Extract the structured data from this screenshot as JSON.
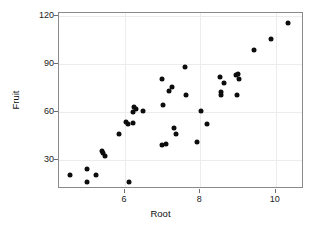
{
  "chart_data": {
    "type": "scatter",
    "title": "",
    "xlabel": "Root",
    "ylabel": "Fruit",
    "xlim": [
      4.25,
      10.75
    ],
    "ylim": [
      12,
      122
    ],
    "xticks": [
      6,
      8,
      10
    ],
    "yticks": [
      30,
      60,
      90,
      120
    ],
    "grid": true,
    "legend": null,
    "marker": "filled-circle",
    "marker_color": "#0d0d0d",
    "n_points": 40,
    "points": [
      {
        "x": 4.55,
        "y": 21.0
      },
      {
        "x": 5.0,
        "y": 24.5
      },
      {
        "x": 4.98,
        "y": 16.5
      },
      {
        "x": 5.22,
        "y": 21.0
      },
      {
        "x": 5.38,
        "y": 35.5
      },
      {
        "x": 5.42,
        "y": 34.5
      },
      {
        "x": 5.47,
        "y": 32.5
      },
      {
        "x": 5.83,
        "y": 46.5
      },
      {
        "x": 6.02,
        "y": 54.0
      },
      {
        "x": 6.08,
        "y": 52.5
      },
      {
        "x": 6.1,
        "y": 16.5
      },
      {
        "x": 6.22,
        "y": 60.0
      },
      {
        "x": 6.25,
        "y": 63.5
      },
      {
        "x": 6.3,
        "y": 62.0
      },
      {
        "x": 6.22,
        "y": 53.0
      },
      {
        "x": 6.48,
        "y": 60.5
      },
      {
        "x": 6.98,
        "y": 81.0
      },
      {
        "x": 7.0,
        "y": 64.5
      },
      {
        "x": 6.98,
        "y": 39.5
      },
      {
        "x": 7.08,
        "y": 40.0
      },
      {
        "x": 7.18,
        "y": 73.5
      },
      {
        "x": 7.25,
        "y": 75.5
      },
      {
        "x": 7.3,
        "y": 50.0
      },
      {
        "x": 7.35,
        "y": 46.5
      },
      {
        "x": 7.6,
        "y": 88.0
      },
      {
        "x": 7.62,
        "y": 71.0
      },
      {
        "x": 7.9,
        "y": 41.5
      },
      {
        "x": 8.02,
        "y": 60.5
      },
      {
        "x": 8.18,
        "y": 52.5
      },
      {
        "x": 8.52,
        "y": 82.0
      },
      {
        "x": 8.55,
        "y": 72.5
      },
      {
        "x": 8.55,
        "y": 71.0
      },
      {
        "x": 8.62,
        "y": 78.0
      },
      {
        "x": 8.95,
        "y": 83.5
      },
      {
        "x": 9.0,
        "y": 84.0
      },
      {
        "x": 9.02,
        "y": 81.0
      },
      {
        "x": 8.98,
        "y": 71.0
      },
      {
        "x": 9.42,
        "y": 99.0
      },
      {
        "x": 9.88,
        "y": 105.5
      },
      {
        "x": 10.32,
        "y": 115.5
      }
    ]
  },
  "axes": {
    "ylabel_text": "Fruit",
    "xlabel_text": "Root",
    "ytick_labels": [
      "120",
      "90",
      "60",
      "30"
    ],
    "xtick_labels": [
      "6",
      "8",
      "10"
    ]
  }
}
